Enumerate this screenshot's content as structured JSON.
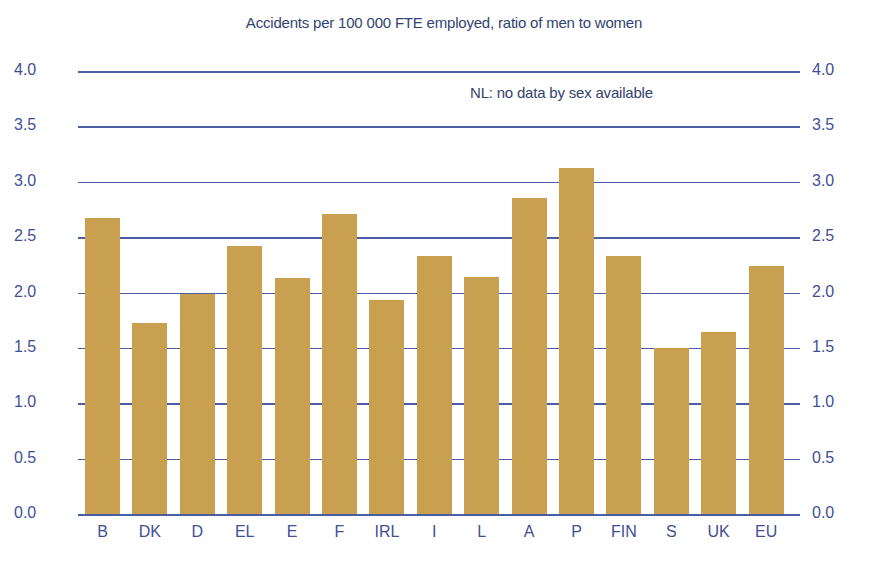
{
  "chart_data": {
    "type": "bar",
    "title": "Accidents per 100 000 FTE employed, ratio of men to women",
    "annotation": "NL: no data by sex available",
    "xlabel": "",
    "ylabel": "",
    "ylim": [
      0.0,
      4.0
    ],
    "yticks": [
      "0.0",
      "0.5",
      "1.0",
      "1.5",
      "2.0",
      "2.5",
      "3.0",
      "3.5",
      "4.0"
    ],
    "grid": true,
    "legend": null,
    "categories": [
      "B",
      "DK",
      "D",
      "EL",
      "E",
      "F",
      "IRL",
      "I",
      "L",
      "A",
      "P",
      "FIN",
      "S",
      "UK",
      "EU"
    ],
    "values": [
      2.68,
      1.73,
      2.0,
      2.43,
      2.14,
      2.72,
      1.94,
      2.34,
      2.15,
      2.86,
      3.13,
      2.34,
      1.51,
      1.65,
      2.25
    ],
    "colors": {
      "bar": "#c9a04f",
      "grid": "#4a5fa3",
      "text": "#3f4f96"
    }
  }
}
